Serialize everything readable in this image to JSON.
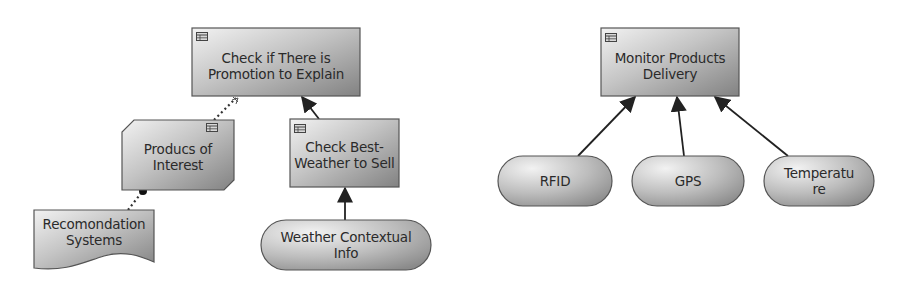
{
  "diagram": {
    "colors": {
      "node_fill_light": "#f0f0f0",
      "node_fill_dark": "#858585",
      "node_border": "#555555",
      "edge": "#222222",
      "text": "#2a2a2a",
      "background": "#ffffff"
    },
    "left": {
      "goal": {
        "label_line1": "Check if There is",
        "label_line2": "Promotion to Explain",
        "icon": "table-icon",
        "shape": "rectangle"
      },
      "products": {
        "label_line1": "Producs of",
        "label_line2": "Interest",
        "icon": "table-icon",
        "shape": "clipped-rectangle"
      },
      "recommendation": {
        "label_line1": "Recomondation",
        "label_line2": "Systems",
        "shape": "document"
      },
      "check_weather": {
        "label_line1": "Check Best-",
        "label_line2": "Weather to Sell",
        "icon": "table-icon",
        "shape": "rectangle"
      },
      "weather_info": {
        "label_line1": "Weather Contextual",
        "label_line2": "Info",
        "shape": "pill"
      }
    },
    "right": {
      "monitor": {
        "label_line1": "Monitor Products",
        "label_line2": "Delivery",
        "icon": "table-icon",
        "shape": "rectangle"
      },
      "rfid": {
        "label": "RFID",
        "shape": "pill"
      },
      "gps": {
        "label": "GPS",
        "shape": "pill"
      },
      "temperature": {
        "label_line1": "Temperatu",
        "label_line2": "re",
        "shape": "pill"
      }
    },
    "edges": [
      {
        "from": "products",
        "to": "goal",
        "style": "dotted",
        "end": "cross-marker"
      },
      {
        "from": "recommendation",
        "to": "products",
        "style": "dotted",
        "end": "filled-dot"
      },
      {
        "from": "check_weather",
        "to": "goal",
        "style": "solid",
        "end": "arrow"
      },
      {
        "from": "weather_info",
        "to": "check_weather",
        "style": "solid",
        "end": "arrow"
      },
      {
        "from": "rfid",
        "to": "monitor",
        "style": "solid",
        "end": "arrow"
      },
      {
        "from": "gps",
        "to": "monitor",
        "style": "solid",
        "end": "arrow"
      },
      {
        "from": "temperature",
        "to": "monitor",
        "style": "solid",
        "end": "arrow"
      }
    ]
  }
}
